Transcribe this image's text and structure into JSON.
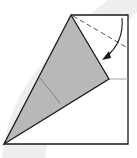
{
  "diagram": {
    "type": "origami-fold-step",
    "colors": {
      "background": "#ffffff",
      "paper_white": "#ffffff",
      "paper_colored": "#b8b8b8",
      "outline": "#1a1a1a",
      "crease": "#8a8a8a",
      "background_arc": "#ececec"
    },
    "elements": {
      "square_outline": "paper-square",
      "folded_flap": "gray-kite-flap",
      "valley_fold_line": "dashed-line",
      "fold_arrow": "curved-arrow",
      "crease_line": "inner-crease"
    }
  }
}
